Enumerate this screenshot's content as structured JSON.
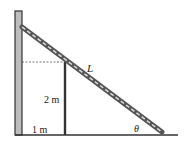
{
  "diagram": {
    "type": "physics-ladder-over-fence",
    "labels": {
      "ladder_length": "L",
      "post_height": "2 m",
      "post_distance": "1 m",
      "angle": "θ"
    },
    "colors": {
      "wall_fill": "#bdbdbd",
      "wall_stroke": "#333333",
      "ladder_dark": "#555555",
      "ladder_light": "#d8d8d8",
      "post": "#333333",
      "ground": "#333333",
      "dashed": "#555555"
    }
  }
}
